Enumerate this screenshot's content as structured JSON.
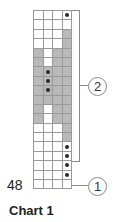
{
  "title": "Chart 1",
  "row_label": "48",
  "callouts": [
    {
      "id": "1",
      "label": "1"
    },
    {
      "id": "2",
      "label": "2"
    }
  ],
  "colors": {
    "shaded": "#b9b9b9",
    "empty": "#ffffff",
    "dot": "#2a2a2a",
    "grid_line": "#9a9a9a"
  },
  "grid": {
    "columns": 4,
    "rows": [
      [
        "w",
        "w",
        "w",
        "wd"
      ],
      [
        "w",
        "w",
        "w",
        "w"
      ],
      [
        "w",
        "w",
        "w",
        "g"
      ],
      [
        "w",
        "w",
        "w",
        "g"
      ],
      [
        "g",
        "w",
        "g",
        "g"
      ],
      [
        "g",
        "w",
        "g",
        "g"
      ],
      [
        "g",
        "gd",
        "g",
        "g"
      ],
      [
        "g",
        "gd",
        "g",
        "g"
      ],
      [
        "g",
        "gd",
        "g",
        "g"
      ],
      [
        "g",
        "g",
        "g",
        "g"
      ],
      [
        "g",
        "w",
        "g",
        "g"
      ],
      [
        "g",
        "w",
        "g",
        "g"
      ],
      [
        "w",
        "w",
        "w",
        "g"
      ],
      [
        "w",
        "w",
        "w",
        "g"
      ],
      [
        "w",
        "w",
        "w",
        "wd"
      ],
      [
        "w",
        "w",
        "w",
        "wd"
      ],
      [
        "w",
        "w",
        "w",
        "wd"
      ],
      [
        "w",
        "w",
        "w",
        "wd"
      ],
      [
        "w",
        "w",
        "w",
        "w"
      ]
    ]
  }
}
